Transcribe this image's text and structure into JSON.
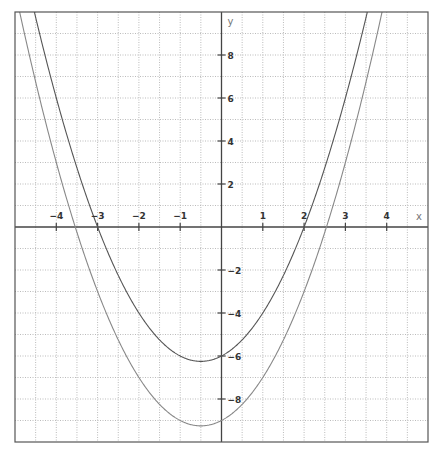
{
  "chart_data": {
    "type": "line",
    "title": "",
    "xlabel": "x",
    "ylabel": "y",
    "xlim": [
      -5,
      5
    ],
    "ylim": [
      -10,
      10
    ],
    "grid": true,
    "legend": null,
    "x_ticks": [
      -4,
      -3,
      -2,
      -1,
      1,
      2,
      3,
      4
    ],
    "y_ticks": [
      -8,
      -6,
      -4,
      -2,
      2,
      4,
      6,
      8
    ],
    "series": [
      {
        "name": "y = x^2 + x - 6",
        "coefficients": [
          1,
          1,
          -6
        ],
        "vertex": [
          -0.5,
          -6.25
        ],
        "roots": [
          -3,
          2
        ],
        "y_intercept": -6,
        "color": "#555555"
      },
      {
        "name": "y = x^2 + x - 9",
        "coefficients": [
          1,
          1,
          -9
        ],
        "vertex": [
          -0.5,
          -9.25
        ],
        "roots": [
          -3.54,
          2.54
        ],
        "y_intercept": -9,
        "color": "#888888"
      }
    ]
  },
  "plot": {
    "frame": {
      "left": 15,
      "top": 12,
      "right": 428,
      "bottom": 442
    },
    "colors": {
      "frame": "#555555",
      "axis": "#444444",
      "grid": "#bbbbbb",
      "curve1": "#555555",
      "curve2": "#888888"
    }
  }
}
